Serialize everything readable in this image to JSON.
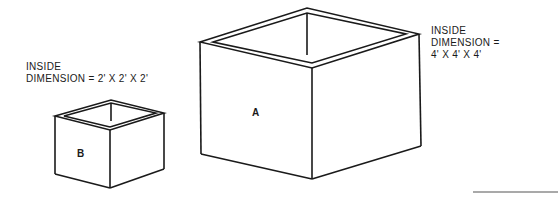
{
  "boxes": [
    {
      "id": "A",
      "label": "A",
      "caption": {
        "line1": "INSIDE",
        "line2": "DIMENSION =",
        "line3": "4' X 4' X 4'"
      }
    },
    {
      "id": "B",
      "label": "B",
      "caption": {
        "line1": "INSIDE",
        "line2": "DIMENSION = 2' X 2' X 2'"
      }
    }
  ],
  "colors": {
    "stroke": "#1a1a1a",
    "background": "#ffffff"
  }
}
